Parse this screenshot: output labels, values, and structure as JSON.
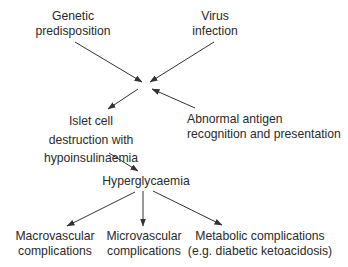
{
  "diagram": {
    "nodes": {
      "genetic": {
        "lines": [
          "Genetic",
          "predisposition"
        ]
      },
      "virus": {
        "lines": [
          "Virus",
          "infection"
        ]
      },
      "islet": {
        "lines": [
          "Islet cell",
          "destruction with",
          "hypoinsulinaemia"
        ]
      },
      "antigen": {
        "lines": [
          "Abnormal antigen",
          "recognition and presentation"
        ]
      },
      "hyperglycaemia": {
        "lines": [
          "Hyperglycaemia"
        ]
      },
      "macrovascular": {
        "lines": [
          "Macrovascular",
          "complications"
        ]
      },
      "microvascular": {
        "lines": [
          "Microvascular",
          "complications"
        ]
      },
      "metabolic": {
        "lines": [
          "Metabolic complications",
          "(e.g. diabetic ketoacidosis)"
        ]
      }
    },
    "edges": [
      {
        "from": "genetic",
        "to": "convergence"
      },
      {
        "from": "virus",
        "to": "convergence"
      },
      {
        "from": "antigen",
        "to": "convergence"
      },
      {
        "from": "convergence",
        "to": "islet"
      },
      {
        "from": "islet",
        "to": "hyperglycaemia"
      },
      {
        "from": "hyperglycaemia",
        "to": "macrovascular"
      },
      {
        "from": "hyperglycaemia",
        "to": "microvascular"
      },
      {
        "from": "hyperglycaemia",
        "to": "metabolic"
      }
    ],
    "colors": {
      "text": "#2a2a2a",
      "arrow": "#333333",
      "background": "#ffffff"
    }
  }
}
